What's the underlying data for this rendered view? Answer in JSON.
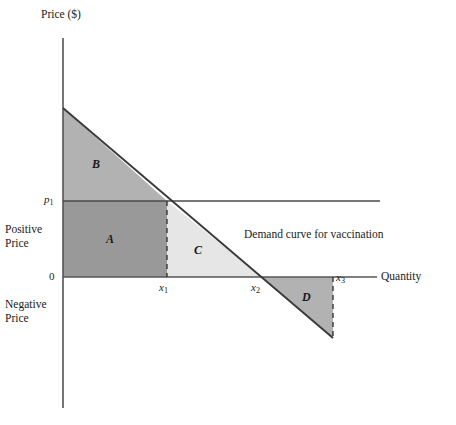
{
  "figure": {
    "title_none": "",
    "background": "#ffffff",
    "axis_color": "#4d4d4d",
    "curve_color": "#3a3a3a"
  },
  "axes": {
    "y_title": "Price ($)",
    "x_title": "Quantity",
    "origin_label": "0",
    "price_tick_label": "p",
    "price_tick_sub": "1",
    "positive_price_label": "Positive\nPrice",
    "negative_price_label": "Negative\nPrice"
  },
  "ticks": {
    "x": [
      {
        "name": "x1",
        "base": "x",
        "sub": "1"
      },
      {
        "name": "x2",
        "base": "x",
        "sub": "2"
      },
      {
        "name": "x3",
        "base": "x",
        "sub": "3"
      }
    ]
  },
  "annotations": {
    "demand_curve_label": "Demand curve for vaccination"
  },
  "regions": [
    {
      "id": "A",
      "label": "A",
      "color": "#999999",
      "shape": "rectangle",
      "description": "consumer expenditure at price p1"
    },
    {
      "id": "B",
      "label": "B",
      "color": "#b2b2b2",
      "shape": "triangle",
      "description": "consumer surplus above p1"
    },
    {
      "id": "C",
      "label": "C",
      "color": "#e6e6e6",
      "shape": "triangle",
      "description": "surplus between x1 and x2"
    },
    {
      "id": "D",
      "label": "D",
      "color": "#b2b2b2",
      "shape": "triangle",
      "description": "negative price region between x2 and x3"
    }
  ],
  "chart_data": {
    "type": "line",
    "title": "",
    "xlabel": "Quantity",
    "ylabel": "Price ($)",
    "grid": false,
    "legend": "none",
    "series": [
      {
        "name": "Demand curve for vaccination",
        "points": [
          {
            "x": 0,
            "y": 1.74
          },
          {
            "x": 1.0,
            "y": 1.0
          },
          {
            "x": 1.87,
            "y": 0.0
          },
          {
            "x": 2.68,
            "y": -0.92
          }
        ]
      },
      {
        "name": "Price line p1",
        "points": [
          {
            "x": 0,
            "y": 1.0
          },
          {
            "x": 3.13,
            "y": 1.0
          }
        ]
      }
    ],
    "markers": [
      {
        "label": "p1",
        "axis": "y",
        "value": 1.0
      },
      {
        "label": "x1",
        "axis": "x",
        "value": 1.0
      },
      {
        "label": "x2",
        "axis": "x",
        "value": 1.87
      },
      {
        "label": "x3",
        "axis": "x",
        "value": 2.68
      },
      {
        "label": "0",
        "axis": "origin",
        "value": 0
      }
    ],
    "xlim": [
      0,
      3.35
    ],
    "ylim": [
      -1.9,
      1.9
    ]
  }
}
